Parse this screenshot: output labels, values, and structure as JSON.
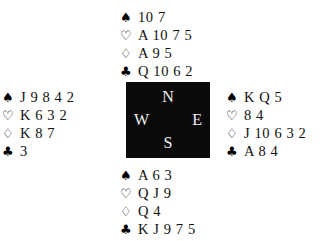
{
  "diagram": {
    "type": "bridge-hand-diagram",
    "background_color": "#ffffff",
    "text_color": "#111111"
  },
  "suits": {
    "spade": {
      "name": "spade-icon",
      "glyph": "♠",
      "filled": true
    },
    "heart": {
      "name": "heart-icon",
      "glyph": "♡",
      "filled": false
    },
    "diamond": {
      "name": "diamond-icon",
      "glyph": "♢",
      "filled": false
    },
    "club": {
      "name": "club-icon",
      "glyph": "♣",
      "filled": true
    }
  },
  "compass": {
    "background_color": "#0a0a0a",
    "letter_color": "#f2f2f2",
    "north": "N",
    "west": "W",
    "east": "E",
    "south": "S"
  },
  "hands": {
    "north": {
      "position": "North",
      "spades": "10 7",
      "hearts": "A 10 7 5",
      "diamonds": "A 9 5",
      "clubs": "Q 10 6 2"
    },
    "west": {
      "position": "West",
      "spades": "J 9 8 4 2",
      "hearts": "K 6 3 2",
      "diamonds": "K 8 7",
      "clubs": "3"
    },
    "east": {
      "position": "East",
      "spades": "K Q 5",
      "hearts": "8 4",
      "diamonds": "J 10 6 3 2",
      "clubs": "A 8 4"
    },
    "south": {
      "position": "South",
      "spades": "A 6 3",
      "hearts": "Q J 9",
      "diamonds": "Q 4",
      "clubs": "K J 9 7 5"
    }
  }
}
